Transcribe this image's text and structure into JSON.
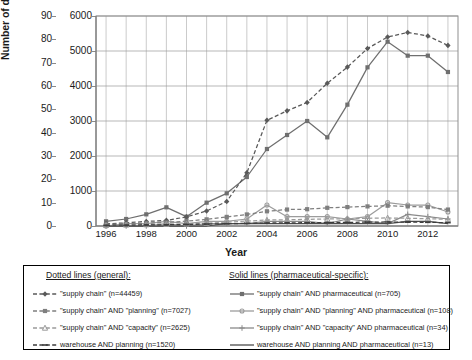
{
  "chart_data": {
    "type": "line",
    "title": "",
    "xlabel": "Year",
    "ylabel": "Number of documents",
    "x": [
      1996,
      1997,
      1998,
      1999,
      2000,
      2001,
      2002,
      2003,
      2004,
      2005,
      2006,
      2007,
      2008,
      2009,
      2010,
      2011,
      2012,
      2013
    ],
    "xticks": [
      "1996",
      "1998",
      "2000",
      "2002",
      "2004",
      "2006",
      "2008",
      "2010",
      "2012"
    ],
    "xlim": [
      1995.5,
      2013.5
    ],
    "grid": true,
    "legend_position": "below-plot",
    "axes": [
      {
        "id": "left",
        "label": "Number of documents",
        "ylim": [
          0,
          90
        ],
        "ticks": [
          0,
          10,
          20,
          30,
          40,
          50,
          60,
          70,
          80,
          90
        ],
        "applies_to": "solid (pharmaceutical-specific) series"
      },
      {
        "id": "right",
        "label": "",
        "ylim": [
          0,
          6000
        ],
        "ticks": [
          0,
          1000,
          2000,
          3000,
          4000,
          5000,
          6000
        ],
        "applies_to": "dotted (general) series"
      }
    ],
    "series": [
      {
        "name": "\"supply chain\" (n=44459)",
        "group": "dotted",
        "axis": "right",
        "style": "dashed",
        "marker": "diamond",
        "color": "#595959",
        "values": [
          60,
          90,
          130,
          160,
          260,
          430,
          700,
          1520,
          3020,
          3290,
          3530,
          4080,
          4540,
          5070,
          5400,
          5530,
          5430,
          5160
        ]
      },
      {
        "name": "\"supply chain\" AND \"planning\" (n=7027)",
        "group": "dotted",
        "axis": "right",
        "style": "dashed",
        "marker": "square",
        "color": "#7f7f7f",
        "values": [
          40,
          60,
          80,
          100,
          140,
          190,
          260,
          330,
          420,
          470,
          480,
          520,
          540,
          560,
          580,
          560,
          540,
          470
        ]
      },
      {
        "name": "\"supply chain\" AND \"capacity\" (n=2625)",
        "group": "dotted",
        "axis": "right",
        "style": "dashed",
        "marker": "triangle",
        "color": "#9a9a9a",
        "values": [
          20,
          30,
          40,
          50,
          60,
          80,
          110,
          140,
          170,
          180,
          190,
          200,
          210,
          220,
          230,
          220,
          210,
          190
        ]
      },
      {
        "name": "warehouse AND planning (n=1520)",
        "group": "dotted",
        "axis": "right",
        "style": "dashed",
        "marker": "dash",
        "color": "#3d3d3d",
        "values": [
          20,
          25,
          30,
          35,
          45,
          55,
          65,
          75,
          85,
          90,
          95,
          100,
          105,
          110,
          115,
          110,
          105,
          95
        ]
      },
      {
        "name": "\"supply chain\" AND pharmaceutical (n=705)",
        "group": "solid",
        "axis": "left",
        "style": "solid",
        "marker": "square",
        "color": "#6f6f6f",
        "values": [
          2,
          3,
          5,
          8,
          4,
          10,
          14,
          21,
          33,
          39,
          45,
          38,
          52,
          68,
          79,
          73,
          73,
          66
        ]
      },
      {
        "name": "\"supply chain\" AND \"planning\" AND pharmaceutical (n=108)",
        "group": "solid",
        "axis": "left",
        "style": "solid",
        "marker": "circle",
        "color": "#9c9c9c",
        "values": [
          0,
          1,
          1,
          2,
          1,
          2,
          2,
          3,
          9,
          4,
          4,
          4,
          3,
          4,
          10,
          9,
          9,
          6
        ]
      },
      {
        "name": "\"supply chain\" AND \"capacity\" AND pharmaceutical (n=34)",
        "group": "solid",
        "axis": "left",
        "style": "solid",
        "marker": "plus",
        "color": "#8a8a8a",
        "values": [
          0,
          0,
          0,
          1,
          0,
          1,
          1,
          1,
          2,
          2,
          2,
          1,
          3,
          2,
          1,
          5,
          4,
          3
        ]
      },
      {
        "name": "warehouse AND planning AND pharmaceutical (n=13)",
        "group": "solid",
        "axis": "left",
        "style": "solid",
        "marker": "none",
        "color": "#4d4d4d",
        "values": [
          0,
          0,
          0,
          0,
          0,
          0,
          1,
          1,
          1,
          1,
          1,
          1,
          1,
          1,
          1,
          2,
          2,
          1
        ]
      }
    ]
  },
  "legend": {
    "dotted_heading": "Dotted lines (general):",
    "solid_heading": "Solid lines (pharmaceutical-specific):",
    "dotted_items": [
      "\"supply chain\" (n=44459)",
      "\"supply chain\" AND \"planning\" (n=7027)",
      "\"supply chain\" AND \"capacity\" (n=2625)",
      "warehouse AND planning (n=1520)"
    ],
    "solid_items": [
      "\"supply chain\" AND pharmaceutical (n=705)",
      "\"supply chain\" AND \"planning\" AND pharmaceutical (n=108)",
      "\"supply chain\" AND \"capacity\" AND pharmaceutical (n=34)",
      "warehouse AND planning AND pharmaceutical (n=13)"
    ]
  },
  "axis_labels": {
    "y_left_ticks": [
      "90",
      "80",
      "70",
      "60",
      "50",
      "40",
      "30",
      "20",
      "10",
      "0"
    ],
    "y_right_ticks": [
      "6000",
      "5000",
      "4000",
      "3000",
      "2000",
      "1000",
      "0"
    ],
    "x_ticks": [
      "1996",
      "1998",
      "2000",
      "2002",
      "2004",
      "2006",
      "2008",
      "2010",
      "2012"
    ],
    "y_title": "Number of documents",
    "x_title": "Year"
  }
}
